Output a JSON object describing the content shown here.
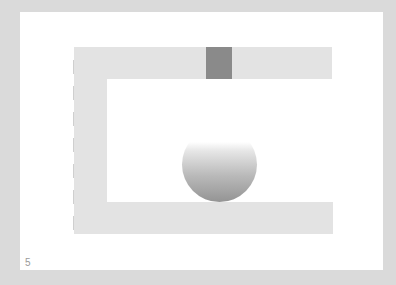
{
  "game": {
    "level_number": "5",
    "colors": {
      "background": "#dadada",
      "panel": "#ffffff",
      "wall": "#e3e3e3",
      "block": "#8a8a8a",
      "ball_bottom": "#949494"
    },
    "elements": {
      "walls": [
        "top-wall",
        "left-wall",
        "bottom-wall"
      ],
      "movable_block": "dark-gray-block",
      "ball": "gray-gradient-ball"
    }
  }
}
